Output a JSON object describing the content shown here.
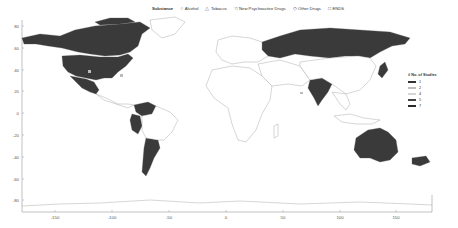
{
  "legend_substance": {
    "title": "Substance",
    "items": [
      {
        "glyph": "○",
        "label": "Alcohol",
        "icon": "circle-icon"
      },
      {
        "glyph": "△",
        "label": "Tobacco",
        "icon": "triangle-icon"
      },
      {
        "glyph": "☆",
        "label": "New Psychoactive Drugs",
        "icon": "star-icon"
      },
      {
        "glyph": "◇",
        "label": "Other Drugs",
        "icon": "diamond-icon"
      },
      {
        "glyph": "□",
        "label": "ENDS",
        "icon": "square-icon"
      }
    ]
  },
  "legend_studies": {
    "title": "# No. of Studies",
    "items": [
      {
        "label": "1",
        "color": "#333333"
      },
      {
        "label": "2",
        "color": "#bdbdbd"
      },
      {
        "label": "4",
        "color": "#d6d6d6"
      },
      {
        "label": "5",
        "color": "#444444"
      },
      {
        "label": "7",
        "color": "#2a2a2a"
      }
    ]
  },
  "axes": {
    "x_ticks": [
      "-150",
      "-100",
      "-50",
      "0",
      "50",
      "100",
      "150"
    ],
    "y_ticks": [
      "80",
      "60",
      "40",
      "20",
      "0",
      "-20",
      "-40",
      "-60",
      "-80"
    ]
  },
  "map": {
    "type": "choropleth world map",
    "highlighted_regions": [
      "Canada",
      "United States",
      "Mexico",
      "Colombia/Venezuela",
      "Peru",
      "Argentina",
      "Russia",
      "India",
      "Japan",
      "Australia",
      "New Zealand"
    ],
    "fill_color": "#3a3a3a",
    "land_outline_color": "#888888"
  }
}
